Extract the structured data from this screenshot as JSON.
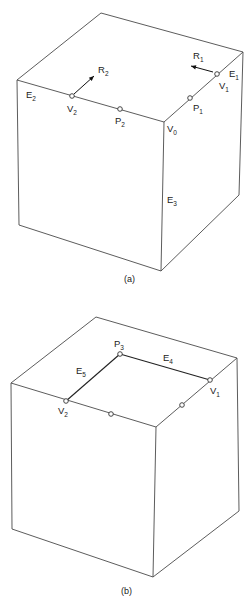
{
  "figures": [
    {
      "id": "a",
      "caption": "(a)",
      "cube": {
        "top_back": [
          101,
          13
        ],
        "left": [
          17,
          80
        ],
        "right": [
          243,
          52
        ],
        "front": [
          164,
          122
        ],
        "bottom_left": [
          19,
          225
        ],
        "bottom_front": [
          161,
          271
        ],
        "bottom_right": [
          239,
          195
        ]
      },
      "points": [
        {
          "name": "V",
          "sub": "1",
          "x": 217,
          "y": 74
        },
        {
          "name": "P",
          "sub": "1",
          "x": 190,
          "y": 98
        },
        {
          "name": "V",
          "sub": "2",
          "x": 72,
          "y": 96
        },
        {
          "name": "P",
          "sub": "2",
          "x": 120,
          "y": 109
        }
      ],
      "labels": [
        {
          "name": "E",
          "sub": "1",
          "x": 229,
          "y": 77
        },
        {
          "name": "E",
          "sub": "2",
          "x": 26,
          "y": 98
        },
        {
          "name": "E",
          "sub": "3",
          "x": 167,
          "y": 203
        },
        {
          "name": "V",
          "sub": "0",
          "x": 167,
          "y": 132
        },
        {
          "name": "V",
          "sub": "1",
          "x": 219,
          "y": 89
        },
        {
          "name": "P",
          "sub": "1",
          "x": 193,
          "y": 111
        },
        {
          "name": "V",
          "sub": "2",
          "x": 67,
          "y": 112
        },
        {
          "name": "P",
          "sub": "2",
          "x": 115,
          "y": 124
        },
        {
          "name": "R",
          "sub": "1",
          "x": 193,
          "y": 59
        },
        {
          "name": "R",
          "sub": "2",
          "x": 98,
          "y": 73
        }
      ],
      "vectors": [
        {
          "name": "R1",
          "from": [
            213,
            72
          ],
          "to": [
            191,
            66
          ]
        },
        {
          "name": "R2",
          "from": [
            74,
            94
          ],
          "to": [
            94,
            76
          ]
        }
      ]
    },
    {
      "id": "b",
      "caption": "(b)",
      "cube": {
        "top_back": [
          96,
          317
        ],
        "left": [
          11,
          383
        ],
        "right": [
          237,
          358
        ],
        "front": [
          156,
          427
        ],
        "bottom_left": [
          12,
          529
        ],
        "bottom_front": [
          153,
          577
        ],
        "bottom_right": [
          239,
          511
        ]
      },
      "points": [
        {
          "name": "P",
          "sub": "3",
          "x": 120,
          "y": 354
        },
        {
          "name": "V",
          "sub": "1",
          "x": 210,
          "y": 380
        },
        {
          "name": "V",
          "sub": "2",
          "x": 66,
          "y": 401
        },
        {
          "name": "",
          "sub": "",
          "x": 111,
          "y": 414
        },
        {
          "name": "",
          "sub": "",
          "x": 182,
          "y": 405
        }
      ],
      "labels": [
        {
          "name": "P",
          "sub": "3",
          "x": 114,
          "y": 347
        },
        {
          "name": "E",
          "sub": "4",
          "x": 163,
          "y": 361
        },
        {
          "name": "E",
          "sub": "5",
          "x": 76,
          "y": 374
        },
        {
          "name": "V",
          "sub": "1",
          "x": 210,
          "y": 394
        },
        {
          "name": "V",
          "sub": "2",
          "x": 58,
          "y": 414
        }
      ],
      "inner_edges": [
        {
          "name": "E4",
          "from": [
            120,
            354
          ],
          "to": [
            210,
            380
          ]
        },
        {
          "name": "E5",
          "from": [
            120,
            354
          ],
          "to": [
            66,
            401
          ]
        }
      ]
    }
  ],
  "captions": {
    "a": "(a)",
    "b": "(b)"
  }
}
